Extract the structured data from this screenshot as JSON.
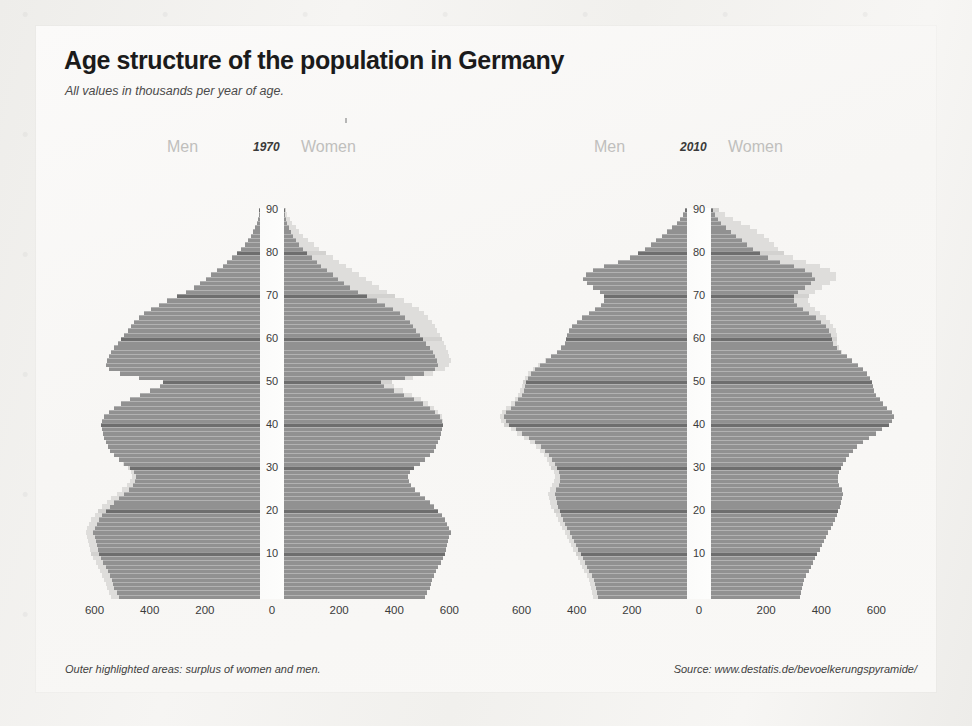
{
  "title": "Age structure of the population in Germany",
  "subtitle": "All values in thousands per year of age.",
  "note": "Outer highlighted areas: surplus of women and men.",
  "source": "Source: www.destatis.de/bevoelkerungspyramide/",
  "labels": {
    "men": "Men",
    "women": "Women"
  },
  "colors": {
    "background": "#f2f1ef",
    "card": "#f9f8f6",
    "bar_main": "#919191",
    "bar_decade": "#6e6e6e",
    "bar_surplus": "#dedddb",
    "title": "#1b1b1b",
    "header_muted": "#c0bfbd"
  },
  "axis": {
    "x_ticks": [
      600,
      400,
      200,
      0,
      200,
      400,
      600
    ],
    "x_max": 700,
    "y_ticks": [
      10,
      20,
      30,
      40,
      50,
      60,
      70,
      80,
      90
    ],
    "y_min": 0,
    "y_max": 90,
    "y_label_unit": "years of age"
  },
  "chart_data": [
    {
      "type": "bar",
      "title": "1970",
      "subtype": "population-pyramid",
      "xlabel": "Population in thousands",
      "ylabel": "Age in years",
      "xlim": [
        -700,
        700
      ],
      "ylim": [
        0,
        90
      ],
      "grid": false,
      "legend": [
        "Men",
        "Women"
      ],
      "legend_position": "top",
      "ages": [
        0,
        1,
        2,
        3,
        4,
        5,
        6,
        7,
        8,
        9,
        10,
        11,
        12,
        13,
        14,
        15,
        16,
        17,
        18,
        19,
        20,
        21,
        22,
        23,
        24,
        25,
        26,
        27,
        28,
        29,
        30,
        31,
        32,
        33,
        34,
        35,
        36,
        37,
        38,
        39,
        40,
        41,
        42,
        43,
        44,
        45,
        46,
        47,
        48,
        49,
        50,
        51,
        52,
        53,
        54,
        55,
        56,
        57,
        58,
        59,
        60,
        61,
        62,
        63,
        64,
        65,
        66,
        67,
        68,
        69,
        70,
        71,
        72,
        73,
        74,
        75,
        76,
        77,
        78,
        79,
        80,
        81,
        82,
        83,
        84,
        85,
        86,
        87,
        88,
        89,
        90
      ],
      "series": [
        {
          "name": "Men",
          "values": [
            540,
            548,
            556,
            560,
            566,
            572,
            580,
            588,
            596,
            604,
            612,
            616,
            620,
            624,
            628,
            630,
            626,
            620,
            612,
            600,
            588,
            572,
            556,
            540,
            520,
            500,
            484,
            472,
            464,
            468,
            480,
            496,
            512,
            528,
            544,
            552,
            560,
            564,
            568,
            572,
            576,
            572,
            564,
            548,
            528,
            504,
            472,
            436,
            400,
            364,
            352,
            440,
            508,
            548,
            560,
            556,
            548,
            540,
            528,
            516,
            504,
            492,
            480,
            468,
            456,
            440,
            420,
            396,
            368,
            336,
            300,
            268,
            240,
            216,
            196,
            176,
            156,
            136,
            118,
            100,
            84,
            68,
            54,
            42,
            32,
            24,
            17,
            12,
            8,
            5,
            3
          ]
        },
        {
          "name": "Women",
          "values": [
            512,
            520,
            528,
            532,
            538,
            544,
            552,
            560,
            568,
            576,
            584,
            588,
            592,
            596,
            600,
            604,
            600,
            592,
            584,
            572,
            560,
            544,
            528,
            512,
            492,
            476,
            460,
            452,
            448,
            456,
            472,
            492,
            512,
            528,
            544,
            552,
            560,
            564,
            568,
            572,
            576,
            576,
            572,
            560,
            544,
            524,
            496,
            464,
            432,
            400,
            392,
            468,
            540,
            584,
            600,
            604,
            600,
            596,
            588,
            580,
            572,
            564,
            556,
            548,
            536,
            524,
            508,
            488,
            464,
            436,
            404,
            372,
            344,
            320,
            296,
            272,
            248,
            224,
            200,
            176,
            152,
            128,
            108,
            88,
            70,
            56,
            42,
            30,
            20,
            12,
            6
          ]
        }
      ]
    },
    {
      "type": "bar",
      "title": "2010",
      "subtype": "population-pyramid",
      "xlabel": "Population in thousands",
      "ylabel": "Age in years",
      "xlim": [
        -700,
        700
      ],
      "ylim": [
        0,
        90
      ],
      "grid": false,
      "legend": [
        "Men",
        "Women"
      ],
      "legend_position": "top",
      "ages": [
        0,
        1,
        2,
        3,
        4,
        5,
        6,
        7,
        8,
        9,
        10,
        11,
        12,
        13,
        14,
        15,
        16,
        17,
        18,
        19,
        20,
        21,
        22,
        23,
        24,
        25,
        26,
        27,
        28,
        29,
        30,
        31,
        32,
        33,
        34,
        35,
        36,
        37,
        38,
        39,
        40,
        41,
        42,
        43,
        44,
        45,
        46,
        47,
        48,
        49,
        50,
        51,
        52,
        53,
        54,
        55,
        56,
        57,
        58,
        59,
        60,
        61,
        62,
        63,
        64,
        65,
        66,
        67,
        68,
        69,
        70,
        71,
        72,
        73,
        74,
        75,
        76,
        77,
        78,
        79,
        80,
        81,
        82,
        83,
        84,
        85,
        86,
        87,
        88,
        89,
        90
      ],
      "series": [
        {
          "name": "Men",
          "values": [
            340,
            344,
            348,
            352,
            356,
            364,
            372,
            380,
            388,
            396,
            404,
            412,
            420,
            428,
            436,
            444,
            452,
            460,
            468,
            476,
            484,
            492,
            496,
            500,
            504,
            496,
            488,
            484,
            480,
            484,
            492,
            500,
            508,
            520,
            532,
            548,
            568,
            592,
            616,
            640,
            664,
            676,
            680,
            672,
            656,
            640,
            624,
            612,
            604,
            600,
            596,
            588,
            576,
            560,
            540,
            516,
            492,
            472,
            456,
            444,
            440,
            436,
            428,
            416,
            400,
            380,
            356,
            332,
            312,
            300,
            300,
            316,
            340,
            364,
            376,
            368,
            340,
            300,
            252,
            208,
            176,
            152,
            132,
            112,
            92,
            72,
            54,
            38,
            26,
            16,
            8
          ]
        },
        {
          "name": "Women",
          "values": [
            322,
            326,
            330,
            334,
            338,
            346,
            354,
            362,
            370,
            378,
            386,
            394,
            402,
            410,
            418,
            426,
            434,
            442,
            450,
            456,
            462,
            468,
            472,
            476,
            480,
            474,
            466,
            462,
            460,
            464,
            472,
            480,
            490,
            502,
            514,
            530,
            550,
            574,
            598,
            622,
            646,
            658,
            664,
            656,
            640,
            624,
            612,
            600,
            592,
            588,
            584,
            576,
            566,
            552,
            534,
            512,
            492,
            476,
            464,
            456,
            456,
            456,
            452,
            444,
            432,
            416,
            396,
            376,
            360,
            352,
            356,
            376,
            404,
            432,
            452,
            452,
            432,
            396,
            344,
            296,
            264,
            244,
            228,
            212,
            192,
            168,
            140,
            110,
            80,
            52,
            28
          ]
        }
      ]
    }
  ]
}
